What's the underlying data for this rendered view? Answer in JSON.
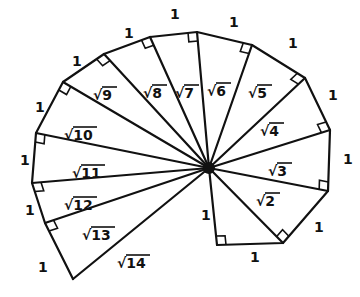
{
  "diagram": {
    "center": [
      209,
      168
    ],
    "center_dot_color": "#111111",
    "line_color": "#111111",
    "outer_vertices": [
      [
        217,
        245
      ],
      [
        283,
        243
      ],
      [
        328,
        191
      ],
      [
        330,
        130
      ],
      [
        305,
        78
      ],
      [
        252,
        45
      ],
      [
        197,
        32
      ],
      [
        150,
        37
      ],
      [
        104,
        54
      ],
      [
        63,
        82
      ],
      [
        36,
        133
      ],
      [
        32,
        183
      ],
      [
        45,
        223
      ],
      [
        73,
        279
      ]
    ],
    "unit_labels": [
      {
        "text": "1",
        "x": 201,
        "y": 220
      },
      {
        "text": "1",
        "x": 250,
        "y": 262
      },
      {
        "text": "1",
        "x": 314,
        "y": 232
      },
      {
        "text": "1",
        "x": 343,
        "y": 164
      },
      {
        "text": "1",
        "x": 328,
        "y": 100
      },
      {
        "text": "1",
        "x": 288,
        "y": 48
      },
      {
        "text": "1",
        "x": 229,
        "y": 27
      },
      {
        "text": "1",
        "x": 170,
        "y": 19
      },
      {
        "text": "1",
        "x": 124,
        "y": 38
      },
      {
        "text": "1",
        "x": 72,
        "y": 66
      },
      {
        "text": "1",
        "x": 35,
        "y": 112
      },
      {
        "text": "1",
        "x": 20,
        "y": 165
      },
      {
        "text": "1",
        "x": 25,
        "y": 215
      },
      {
        "text": "1",
        "x": 38,
        "y": 272
      }
    ],
    "hypotenuse_labels": [
      {
        "text": "√2",
        "rad": "2",
        "x": 256,
        "y": 206
      },
      {
        "text": "√3",
        "rad": "3",
        "x": 268,
        "y": 176
      },
      {
        "text": "√4",
        "rad": "4",
        "x": 260,
        "y": 136
      },
      {
        "text": "√5",
        "rad": "5",
        "x": 248,
        "y": 98
      },
      {
        "text": "√6",
        "rad": "6",
        "x": 207,
        "y": 96
      },
      {
        "text": "√7",
        "rad": "7",
        "x": 175,
        "y": 98
      },
      {
        "text": "√8",
        "rad": "8",
        "x": 143,
        "y": 98
      },
      {
        "text": "√9",
        "rad": "9",
        "x": 93,
        "y": 100
      },
      {
        "text": "√10",
        "rad": "10",
        "x": 64,
        "y": 140
      },
      {
        "text": "√11",
        "rad": "11",
        "x": 72,
        "y": 178
      },
      {
        "text": "√12",
        "rad": "12",
        "x": 64,
        "y": 210
      },
      {
        "text": "√13",
        "rad": "13",
        "x": 82,
        "y": 240
      },
      {
        "text": "√14",
        "rad": "14",
        "x": 117,
        "y": 268
      }
    ]
  }
}
